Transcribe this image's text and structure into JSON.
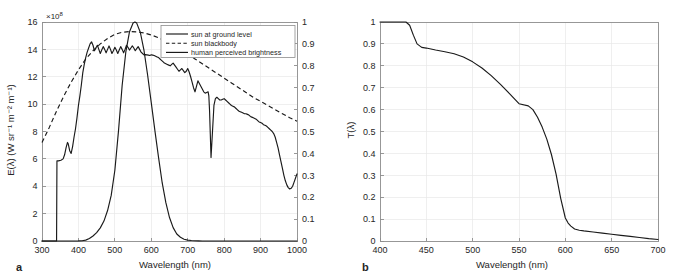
{
  "figure": {
    "panels": [
      {
        "letter": "a"
      },
      {
        "letter": "b"
      }
    ]
  },
  "chart_data": [
    {
      "panel": "a",
      "type": "line",
      "title": "",
      "xlabel": "Wavelength (nm)",
      "ylabel": "E(λ) (W sr⁻¹ m⁻² m⁻¹)",
      "y2label": "",
      "y_multiplier": "×10⁸",
      "y_multiplier_base": "×10",
      "y_multiplier_exp": "8",
      "xlim": [
        300,
        1000
      ],
      "ylim": [
        0,
        16
      ],
      "y2lim": [
        0,
        1
      ],
      "xticks": [
        300,
        400,
        500,
        600,
        700,
        800,
        900,
        1000
      ],
      "xticklabels": [
        "300",
        "400",
        "500",
        "600",
        "700",
        "800",
        "900",
        "1000"
      ],
      "yticks": [
        0,
        2,
        4,
        6,
        8,
        10,
        12,
        14,
        16
      ],
      "yticklabels": [
        "0",
        "2",
        "4",
        "6",
        "8",
        "10",
        "12",
        "14",
        "16"
      ],
      "y2ticks": [
        0,
        0.1,
        0.2,
        0.3,
        0.4,
        0.5,
        0.6,
        0.7,
        0.8,
        0.9,
        1
      ],
      "y2ticklabels": [
        "0",
        "0.1",
        "0.2",
        "0.3",
        "0.4",
        "0.5",
        "0.6",
        "0.7",
        "0.8",
        "0.9",
        "1"
      ],
      "grid": true,
      "legend_position": "top-right",
      "legend": [
        {
          "label": "sun at ground level",
          "style": "solid"
        },
        {
          "label": "sun blackbody",
          "style": "dashed"
        },
        {
          "label": "human perceived brightness",
          "style": "solid"
        }
      ],
      "series": [
        {
          "name": "sun at ground level",
          "style": "solid",
          "axis": "left",
          "x": [
            300,
            336,
            340,
            341,
            345,
            352,
            358,
            362,
            366,
            370,
            372,
            376,
            380,
            384,
            388,
            392,
            396,
            400,
            404,
            408,
            412,
            416,
            420,
            424,
            428,
            432,
            436,
            440,
            444,
            448,
            452,
            456,
            460,
            464,
            468,
            472,
            476,
            480,
            484,
            488,
            492,
            496,
            500,
            504,
            508,
            512,
            516,
            520,
            524,
            528,
            532,
            536,
            540,
            544,
            548,
            552,
            556,
            560,
            564,
            568,
            572,
            576,
            580,
            584,
            588,
            592,
            596,
            600,
            604,
            608,
            612,
            616,
            620,
            624,
            628,
            632,
            636,
            640,
            644,
            648,
            652,
            656,
            660,
            664,
            668,
            672,
            676,
            680,
            684,
            688,
            692,
            696,
            700,
            704,
            708,
            712,
            716,
            720,
            724,
            728,
            732,
            736,
            740,
            744,
            748,
            752,
            756,
            758,
            760,
            762,
            764,
            768,
            772,
            776,
            780,
            784,
            788,
            792,
            796,
            800,
            804,
            808,
            812,
            816,
            820,
            824,
            828,
            832,
            836,
            840,
            844,
            848,
            852,
            856,
            860,
            864,
            868,
            872,
            876,
            880,
            884,
            888,
            892,
            896,
            900,
            904,
            908,
            912,
            916,
            920,
            924,
            928,
            932,
            936,
            940,
            944,
            948,
            952,
            956,
            960,
            964,
            968,
            972,
            976,
            980,
            984,
            988,
            992,
            996,
            1000
          ],
          "y": [
            0,
            0,
            0,
            5.85,
            5.85,
            5.9,
            6.0,
            6.3,
            6.8,
            7.2,
            7.1,
            6.6,
            6.4,
            6.9,
            7.6,
            8.2,
            9.0,
            9.9,
            10.6,
            11.4,
            12.3,
            12.9,
            13.4,
            13.8,
            14.1,
            14.4,
            14.55,
            14.3,
            13.9,
            14.1,
            14.3,
            14.0,
            13.7,
            13.95,
            14.2,
            14.0,
            13.75,
            14.0,
            14.25,
            14.0,
            13.7,
            13.9,
            14.15,
            13.95,
            13.7,
            13.95,
            14.2,
            14.0,
            13.75,
            14.0,
            14.3,
            14.15,
            13.95,
            14.1,
            14.25,
            14.1,
            13.9,
            14.05,
            14.2,
            14.0,
            13.8,
            13.7,
            13.6,
            13.62,
            13.6,
            13.58,
            13.55,
            13.6,
            13.58,
            13.55,
            13.5,
            13.45,
            13.4,
            13.3,
            13.2,
            13.1,
            13.0,
            12.95,
            12.9,
            12.85,
            12.8,
            12.9,
            13.0,
            12.85,
            12.7,
            12.55,
            12.4,
            12.5,
            12.6,
            12.45,
            12.3,
            12.4,
            12.6,
            12.35,
            12.0,
            11.6,
            11.2,
            10.9,
            11.3,
            11.7,
            11.5,
            11.3,
            11.1,
            10.9,
            10.8,
            10.85,
            10.9,
            10.6,
            9.5,
            7.8,
            6.1,
            8.0,
            9.9,
            10.4,
            10.5,
            10.4,
            10.3,
            10.3,
            10.35,
            10.4,
            10.3,
            10.2,
            10.1,
            10.0,
            9.9,
            9.85,
            9.8,
            9.7,
            9.6,
            9.5,
            9.45,
            9.4,
            9.35,
            9.3,
            9.3,
            9.25,
            9.2,
            9.1,
            9.05,
            9.0,
            8.95,
            8.9,
            8.8,
            8.7,
            8.65,
            8.6,
            8.5,
            8.45,
            8.4,
            8.3,
            8.2,
            8.1,
            8.0,
            7.85,
            7.6,
            7.2,
            6.8,
            6.3,
            5.8,
            5.3,
            4.8,
            4.4,
            4.1,
            3.9,
            3.8,
            3.85,
            4.0,
            4.3,
            4.6,
            4.9,
            5.2,
            5.45,
            5.65,
            5.8,
            5.95,
            6.05,
            6.1,
            6.15,
            6.2
          ]
        },
        {
          "name": "sun blackbody",
          "style": "dashed",
          "axis": "left",
          "x": [
            300,
            320,
            340,
            360,
            380,
            400,
            420,
            440,
            460,
            480,
            500,
            520,
            540,
            560,
            580,
            600,
            620,
            640,
            660,
            680,
            700,
            720,
            740,
            760,
            780,
            800,
            820,
            840,
            860,
            880,
            900,
            920,
            940,
            960,
            980,
            1000
          ],
          "y": [
            7.2,
            8.3,
            9.5,
            10.6,
            11.6,
            12.5,
            13.3,
            13.9,
            14.4,
            14.8,
            15.1,
            15.25,
            15.3,
            15.28,
            15.2,
            15.05,
            14.85,
            14.6,
            14.3,
            14.0,
            13.65,
            13.3,
            12.95,
            12.6,
            12.25,
            11.9,
            11.55,
            11.2,
            10.85,
            10.5,
            10.2,
            9.9,
            9.6,
            9.3,
            9.0,
            8.75
          ]
        },
        {
          "name": "human perceived brightness",
          "style": "solid",
          "axis": "right",
          "x": [
            300,
            380,
            390,
            400,
            410,
            420,
            430,
            440,
            450,
            460,
            470,
            480,
            490,
            500,
            510,
            520,
            530,
            540,
            550,
            555,
            560,
            570,
            580,
            590,
            600,
            610,
            620,
            630,
            640,
            650,
            660,
            670,
            680,
            690,
            700,
            710,
            720,
            730,
            740,
            760,
            780,
            800,
            1000
          ],
          "y": [
            0,
            0,
            0.0001,
            0.0004,
            0.0012,
            0.004,
            0.0116,
            0.023,
            0.038,
            0.06,
            0.091,
            0.139,
            0.208,
            0.323,
            0.503,
            0.71,
            0.862,
            0.954,
            0.995,
            1.0,
            0.995,
            0.952,
            0.87,
            0.757,
            0.631,
            0.503,
            0.381,
            0.265,
            0.175,
            0.107,
            0.061,
            0.032,
            0.017,
            0.0082,
            0.0041,
            0.0021,
            0.00105,
            0.00052,
            0.00025,
            6e-05,
            1.5e-05,
            5e-06,
            0
          ]
        }
      ]
    },
    {
      "panel": "b",
      "type": "line",
      "title": "",
      "xlabel": "Wavelength (nm)",
      "ylabel": "T(λ)",
      "xlim": [
        400,
        700
      ],
      "ylim": [
        0,
        1
      ],
      "xticks": [
        400,
        450,
        500,
        550,
        600,
        650,
        700
      ],
      "xticklabels": [
        "400",
        "450",
        "500",
        "550",
        "600",
        "650",
        "700"
      ],
      "yticks": [
        0,
        0.1,
        0.2,
        0.3,
        0.4,
        0.5,
        0.6,
        0.7,
        0.8,
        0.9,
        1
      ],
      "yticklabels": [
        "0",
        "0.1",
        "0.2",
        "0.3",
        "0.4",
        "0.5",
        "0.6",
        "0.7",
        "0.8",
        "0.9",
        "1"
      ],
      "grid": true,
      "legend_position": "none",
      "legend": [],
      "series": [
        {
          "name": "transmittance",
          "style": "solid",
          "axis": "left",
          "x": [
            400,
            410,
            420,
            428,
            432,
            436,
            440,
            445,
            450,
            460,
            470,
            480,
            490,
            500,
            510,
            520,
            530,
            540,
            550,
            560,
            565,
            570,
            575,
            580,
            585,
            590,
            595,
            600,
            603,
            606,
            610,
            615,
            620,
            630,
            640,
            650,
            660,
            670,
            680,
            690,
            700
          ],
          "y": [
            1.0,
            1.0,
            1.0,
            1.0,
            0.985,
            0.94,
            0.9,
            0.884,
            0.881,
            0.872,
            0.864,
            0.855,
            0.84,
            0.818,
            0.79,
            0.755,
            0.715,
            0.672,
            0.627,
            0.617,
            0.6,
            0.565,
            0.52,
            0.465,
            0.395,
            0.305,
            0.195,
            0.105,
            0.082,
            0.068,
            0.055,
            0.049,
            0.046,
            0.041,
            0.036,
            0.031,
            0.026,
            0.021,
            0.016,
            0.011,
            0.007
          ]
        }
      ]
    }
  ]
}
